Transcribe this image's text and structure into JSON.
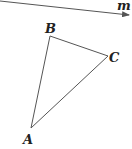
{
  "diagram": {
    "line": {
      "label": "m",
      "from": [
        0,
        1
      ],
      "to": [
        130,
        15
      ]
    },
    "points": {
      "A": {
        "label": "A",
        "x": 31,
        "y": 128
      },
      "B": {
        "label": "B",
        "x": 50,
        "y": 36
      },
      "C": {
        "label": "C",
        "x": 108,
        "y": 56
      }
    },
    "stroke_color": "#555555"
  }
}
